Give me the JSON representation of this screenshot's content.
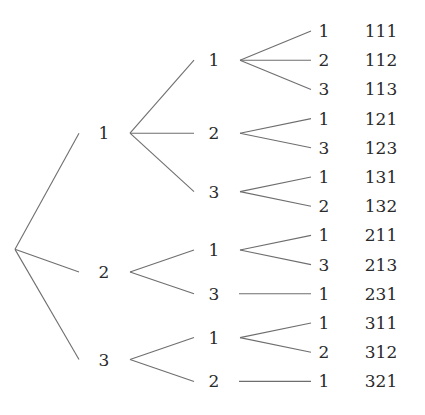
{
  "root": {
    "children": [
      {
        "label": "1",
        "children": [
          {
            "label": "1",
            "children": [
              {
                "label": "1",
                "result": "111"
              },
              {
                "label": "2",
                "result": "112"
              },
              {
                "label": "3",
                "result": "113"
              }
            ]
          },
          {
            "label": "2",
            "children": [
              {
                "label": "1",
                "result": "121"
              },
              {
                "label": "3",
                "result": "123"
              }
            ]
          },
          {
            "label": "3",
            "children": [
              {
                "label": "1",
                "result": "131"
              },
              {
                "label": "2",
                "result": "132"
              }
            ]
          }
        ]
      },
      {
        "label": "2",
        "children": [
          {
            "label": "1",
            "children": [
              {
                "label": "1",
                "result": "211"
              },
              {
                "label": "3",
                "result": "213"
              }
            ]
          },
          {
            "label": "3",
            "children": [
              {
                "label": "1",
                "result": "231"
              }
            ]
          }
        ]
      },
      {
        "label": "3",
        "children": [
          {
            "label": "1",
            "children": [
              {
                "label": "1",
                "result": "311"
              },
              {
                "label": "2",
                "result": "312"
              }
            ]
          },
          {
            "label": "2",
            "children": [
              {
                "label": "1",
                "result": "321"
              }
            ]
          }
        ]
      }
    ]
  }
}
